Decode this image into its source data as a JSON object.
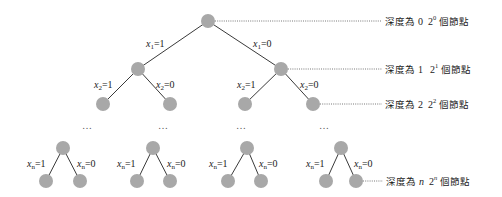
{
  "diagram": {
    "node_color": "#a8a8a8",
    "edge_color": "#3a3a3a",
    "root_edges": {
      "left": {
        "var": "x",
        "sub": "1",
        "eq": "=1"
      },
      "right": {
        "var": "x",
        "sub": "1",
        "eq": "=0"
      }
    },
    "level2_edges": [
      {
        "var": "x",
        "sub": "2",
        "eq": "=1"
      },
      {
        "var": "x",
        "sub": "2",
        "eq": "=0"
      },
      {
        "var": "x",
        "sub": "2",
        "eq": "=1"
      },
      {
        "var": "x",
        "sub": "2",
        "eq": "=0"
      }
    ],
    "ellipsis": [
      "…",
      "…",
      "…",
      "…"
    ],
    "bottom_edges": [
      {
        "left": {
          "var": "x",
          "sub": "n",
          "eq": "=1"
        },
        "right": {
          "var": "x",
          "sub": "n",
          "eq": "=0"
        }
      },
      {
        "left": {
          "var": "x",
          "sub": "n",
          "eq": "=1"
        },
        "right": {
          "var": "x",
          "sub": "n",
          "eq": "=0"
        }
      },
      {
        "left": {
          "var": "x",
          "sub": "n",
          "eq": "=1"
        },
        "right": {
          "var": "x",
          "sub": "n",
          "eq": "=0"
        }
      },
      {
        "left": {
          "var": "x",
          "sub": "n",
          "eq": "=1"
        },
        "right": {
          "var": "x",
          "sub": "n",
          "eq": "=0"
        }
      }
    ],
    "depth_labels": [
      {
        "prefix": "深度為",
        "depth": "0",
        "base": "2",
        "exp": "0",
        "suffix": "個節點"
      },
      {
        "prefix": "深度為",
        "depth": "1",
        "base": "2",
        "exp": "1",
        "suffix": "個節點"
      },
      {
        "prefix": "深度為",
        "depth": "2",
        "base": "2",
        "exp": "2",
        "suffix": "個節點"
      },
      {
        "prefix": "深度為",
        "depth": "n",
        "base": "2",
        "exp": "n",
        "suffix": "個節點"
      }
    ]
  }
}
